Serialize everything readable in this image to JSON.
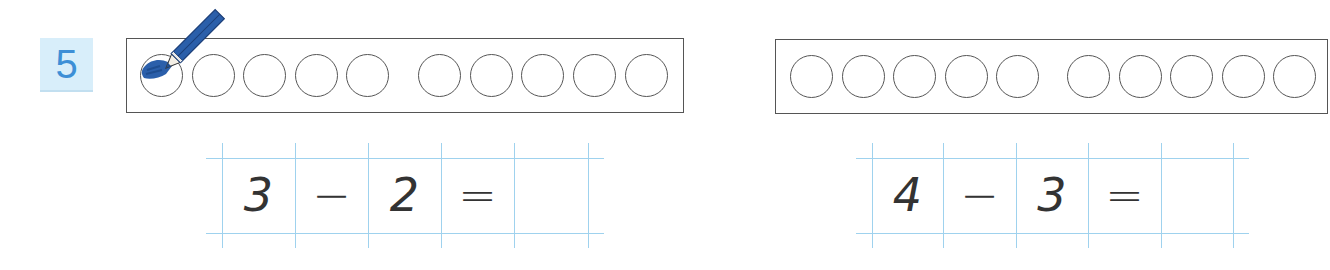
{
  "exercise": {
    "number": "5",
    "badge_bg": "#d8eefa",
    "badge_color": "#3d8fd6",
    "grid_color": "#9fd2ee",
    "pencil_color": "#2b5faa",
    "problems": [
      {
        "id": "left",
        "frame_circles": 10,
        "filled_circles": 1,
        "has_pencil": true,
        "equation": {
          "a": "3",
          "op": "−",
          "b": "2",
          "eq": "=",
          "answer": ""
        }
      },
      {
        "id": "right",
        "frame_circles": 10,
        "filled_circles": 0,
        "has_pencil": false,
        "equation": {
          "a": "4",
          "op": "−",
          "b": "3",
          "eq": "=",
          "answer": ""
        }
      }
    ]
  }
}
